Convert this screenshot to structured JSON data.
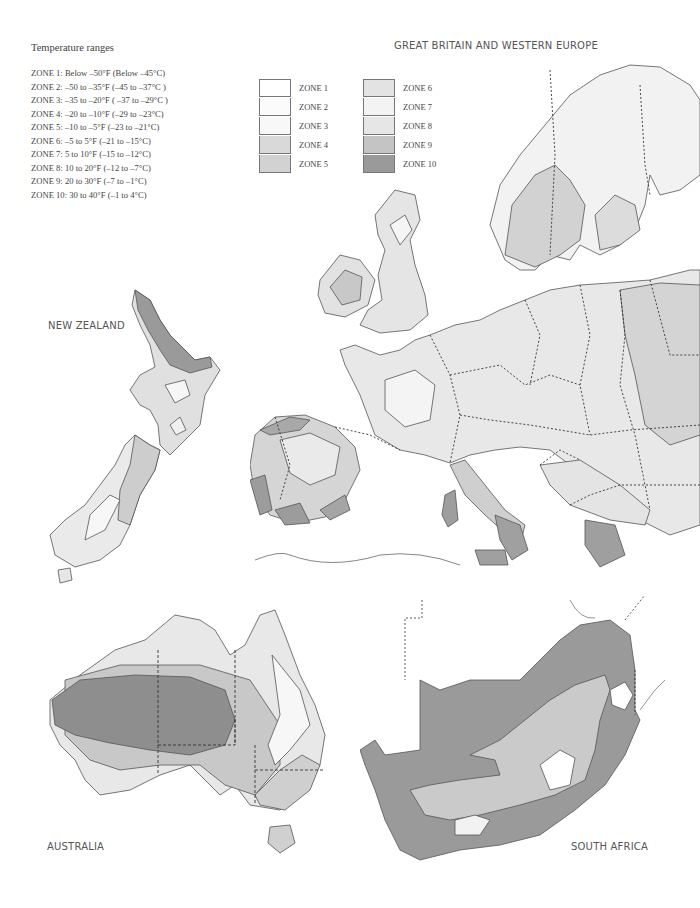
{
  "ranges": {
    "title": "Temperature ranges",
    "items": [
      "ZONE 1: Below –50°F (Below –45°C)",
      "ZONE 2: –50 to –35°F (–45 to –37°C )",
      "ZONE 3: –35 to –20°F ( –37 to –29°C )",
      "ZONE 4: –20 to –10°F (–29 to –23°C)",
      "ZONE 5: –10 to –5°F (–23 to –21°C)",
      "ZONE 6: –5 to 5°F (–21 to –15°C)",
      "ZONE 7: 5 to 10°F (–15 to –12°C)",
      "ZONE 8: 10 to 20°F (–12 to –7°C)",
      "ZONE 9: 20 to 30°F (–7 to –1°C)",
      "ZONE 10: 30 to 40°F (–1 to 4°C)"
    ]
  },
  "legend": {
    "left": [
      {
        "label": "ZONE 1",
        "color": "#ffffff"
      },
      {
        "label": "ZONE 2",
        "color": "#fbfbfb"
      },
      {
        "label": "ZONE 3",
        "color": "#f8f8f8"
      },
      {
        "label": "ZONE 4",
        "color": "#d9d9d9"
      },
      {
        "label": "ZONE 5",
        "color": "#d2d2d2"
      }
    ],
    "right": [
      {
        "label": "ZONE 6",
        "color": "#e3e3e3"
      },
      {
        "label": "ZONE 7",
        "color": "#f3f3f3"
      },
      {
        "label": "ZONE 8",
        "color": "#e6e6e6"
      },
      {
        "label": "ZONE 9",
        "color": "#c4c4c4"
      },
      {
        "label": "ZONE 10",
        "color": "#9a9a9a"
      }
    ]
  },
  "maps": {
    "europe": {
      "label": "GREAT BRITAIN AND WESTERN EUROPE"
    },
    "new_zealand": {
      "label": "NEW ZEALAND"
    },
    "australia": {
      "label": "AUSTRALIA"
    },
    "south_africa": {
      "label": "SOUTH AFRICA"
    }
  }
}
